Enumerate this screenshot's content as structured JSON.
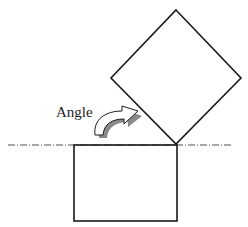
{
  "diagram": {
    "label": "Angle",
    "elements": {
      "reference_line": "dash-dot horizontal reference line",
      "base_block": "rectangle",
      "rotated_block": "square rotated about corner",
      "rotation_arrow": "curved-arrow-icon"
    },
    "colors": {
      "stroke": "#1a1a1a",
      "shadow": "#8a8a8a",
      "dash_line": "#555555",
      "background": "#ffffff"
    }
  }
}
